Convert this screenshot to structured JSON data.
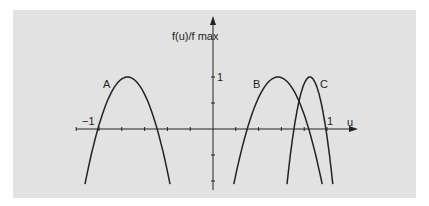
{
  "chart_data": {
    "type": "line",
    "title": "",
    "xlabel": "u",
    "ylabel": "f(u)/f max",
    "xlim": [
      -1.2,
      1.2
    ],
    "ylim": [
      -1.1,
      1.5
    ],
    "grid": false,
    "x_ticks_step": 0.2,
    "y_ticks": [
      -1,
      -0.5,
      0,
      0.5,
      1
    ],
    "tick_labels": {
      "x_neg": "−1",
      "x_pos": "1",
      "y_pos": "1"
    },
    "series": [
      {
        "name": "A",
        "shape": "parabola",
        "peak_u": -0.75,
        "peak_value": 1,
        "roots": [
          -1.0,
          -0.48
        ]
      },
      {
        "name": "B",
        "shape": "parabola",
        "peak_u": 0.57,
        "peak_value": 1,
        "roots": [
          0.3,
          0.84
        ]
      },
      {
        "name": "C",
        "shape": "parabola",
        "peak_u": 0.85,
        "peak_value": 1,
        "roots": [
          0.71,
          0.99
        ]
      }
    ],
    "curve_labels": [
      "A",
      "B",
      "C"
    ]
  },
  "axes": {
    "x_label": "u",
    "y_label": "f(u)/f max",
    "x_neg_tick": "−1",
    "x_pos_tick": "1",
    "y_tick": "1"
  },
  "colors": {
    "panel": "#e2e2e2",
    "ink": "#222222"
  }
}
